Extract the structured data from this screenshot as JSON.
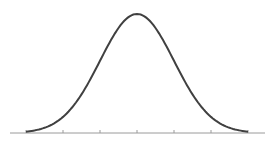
{
  "chart_data": {
    "type": "line",
    "title": "",
    "xlabel": "",
    "ylabel": "",
    "x_ticks": [
      -3,
      -2,
      -1,
      0,
      1,
      2,
      3
    ],
    "x_tick_labels": [],
    "xlim": [
      -3.3,
      3.5
    ],
    "grid": false,
    "legend": [],
    "series": [
      {
        "name": "normal pdf",
        "x": [
          -3,
          -2.5,
          -2,
          -1.5,
          -1,
          -0.5,
          0,
          0.5,
          1,
          1.5,
          2,
          2.5,
          3
        ],
        "values": [
          0.0044,
          0.0175,
          0.054,
          0.1295,
          0.242,
          0.352,
          0.399,
          0.352,
          0.242,
          0.1295,
          0.054,
          0.0175,
          0.0044
        ]
      }
    ],
    "colors": {
      "curve": "#404040",
      "axis": "#9a9a9a"
    }
  }
}
